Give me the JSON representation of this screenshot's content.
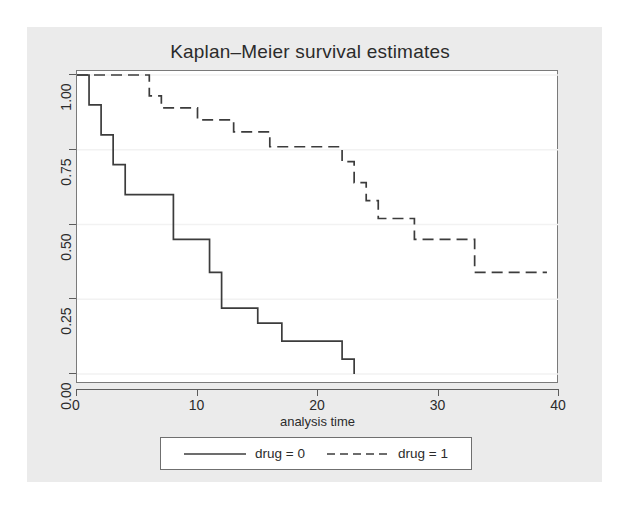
{
  "chart": {
    "title": "Kaplan–Meier survival estimates",
    "xlabel": "analysis time",
    "ylabel": ""
  },
  "axes": {
    "x_ticks": [
      "0",
      "10",
      "20",
      "30",
      "40"
    ],
    "y_ticks": [
      "0.00",
      "0.25",
      "0.50",
      "0.75",
      "1.00"
    ]
  },
  "legend": {
    "entries": [
      {
        "label": "drug = 0",
        "style": "solid"
      },
      {
        "label": "drug = 1",
        "style": "dashed"
      }
    ]
  },
  "colors": {
    "graph_region": "#ebebeb",
    "plot_background": "#ffffff",
    "line": "#3c3c3c",
    "axis": "#5c5c5c",
    "gridline": "#f2f2f2",
    "text": "#2b2b2b"
  },
  "chart_data": {
    "type": "line",
    "title": "Kaplan–Meier survival estimates",
    "xlabel": "analysis time",
    "ylabel": "",
    "xlim": [
      0,
      40
    ],
    "ylim": [
      0,
      1
    ],
    "xticks": [
      0,
      10,
      20,
      30,
      40
    ],
    "yticks": [
      0.0,
      0.25,
      0.5,
      0.75,
      1.0
    ],
    "grid": true,
    "grid_axis": "y",
    "legend_position": "below-plot",
    "step": "post",
    "series": [
      {
        "name": "drug = 0",
        "style": "solid",
        "points": [
          {
            "x": 0,
            "y": 1.0
          },
          {
            "x": 1,
            "y": 1.0
          },
          {
            "x": 1,
            "y": 0.9
          },
          {
            "x": 2,
            "y": 0.9
          },
          {
            "x": 2,
            "y": 0.8
          },
          {
            "x": 3,
            "y": 0.8
          },
          {
            "x": 3,
            "y": 0.7
          },
          {
            "x": 4,
            "y": 0.7
          },
          {
            "x": 4,
            "y": 0.6
          },
          {
            "x": 8,
            "y": 0.6
          },
          {
            "x": 8,
            "y": 0.45
          },
          {
            "x": 11,
            "y": 0.45
          },
          {
            "x": 11,
            "y": 0.34
          },
          {
            "x": 12,
            "y": 0.34
          },
          {
            "x": 12,
            "y": 0.22
          },
          {
            "x": 15,
            "y": 0.22
          },
          {
            "x": 15,
            "y": 0.17
          },
          {
            "x": 17,
            "y": 0.17
          },
          {
            "x": 17,
            "y": 0.11
          },
          {
            "x": 22,
            "y": 0.11
          },
          {
            "x": 22,
            "y": 0.05
          },
          {
            "x": 23,
            "y": 0.05
          },
          {
            "x": 23,
            "y": 0.0
          }
        ]
      },
      {
        "name": "drug = 1",
        "style": "dashed",
        "points": [
          {
            "x": 0,
            "y": 1.0
          },
          {
            "x": 6,
            "y": 1.0
          },
          {
            "x": 6,
            "y": 0.93
          },
          {
            "x": 7,
            "y": 0.93
          },
          {
            "x": 7,
            "y": 0.89
          },
          {
            "x": 10,
            "y": 0.89
          },
          {
            "x": 10,
            "y": 0.85
          },
          {
            "x": 13,
            "y": 0.85
          },
          {
            "x": 13,
            "y": 0.81
          },
          {
            "x": 16,
            "y": 0.81
          },
          {
            "x": 16,
            "y": 0.76
          },
          {
            "x": 22,
            "y": 0.76
          },
          {
            "x": 22,
            "y": 0.71
          },
          {
            "x": 23,
            "y": 0.71
          },
          {
            "x": 23,
            "y": 0.64
          },
          {
            "x": 24,
            "y": 0.64
          },
          {
            "x": 24,
            "y": 0.58
          },
          {
            "x": 25,
            "y": 0.58
          },
          {
            "x": 25,
            "y": 0.52
          },
          {
            "x": 28,
            "y": 0.52
          },
          {
            "x": 28,
            "y": 0.45
          },
          {
            "x": 33,
            "y": 0.45
          },
          {
            "x": 33,
            "y": 0.34
          },
          {
            "x": 39,
            "y": 0.34
          }
        ]
      }
    ]
  }
}
